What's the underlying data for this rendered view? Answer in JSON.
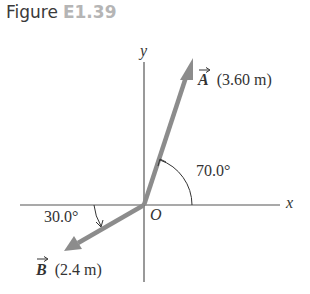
{
  "figure": {
    "label": "Figure",
    "number": "E1.39"
  },
  "axes": {
    "x_label": "x",
    "y_label": "y",
    "origin_label": "O"
  },
  "vectors": [
    {
      "name": "A",
      "magnitude_label": "(3.60 m)",
      "angle_label": "70.0°",
      "angle_deg": 70.0,
      "reference": "positive x-axis",
      "color": "#8c8c8c"
    },
    {
      "name": "B",
      "magnitude_label": "(2.4 m)",
      "angle_label": "30.0°",
      "angle_deg": 30.0,
      "reference": "below negative x-axis",
      "color": "#8c8c8c"
    }
  ],
  "colors": {
    "axis": "#555555",
    "vector": "#8c8c8c",
    "text": "#333333",
    "figure_number": "#b5b5b5"
  }
}
